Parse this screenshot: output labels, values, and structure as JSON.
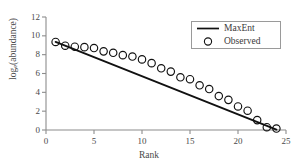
{
  "chart_data": {
    "type": "scatter",
    "title": "",
    "xlabel": "Rank",
    "ylabel_html": "log<sub>e</sub>(abundance)",
    "ylabel": "log_e(abundance)",
    "xlim": [
      0,
      25
    ],
    "ylim": [
      0,
      12
    ],
    "xticks": [
      0,
      5,
      10,
      15,
      20,
      25
    ],
    "yticks": [
      0,
      2,
      4,
      6,
      8,
      10,
      12
    ],
    "grid": false,
    "legend_position": "top-right",
    "series": [
      {
        "name": "MaxEnt",
        "marker": "line",
        "color": "#111111",
        "x": [
          1,
          24
        ],
        "y": [
          9.35,
          0.05
        ]
      },
      {
        "name": "Observed",
        "marker": "open-circle",
        "color": "#111111",
        "x": [
          1,
          2,
          3,
          4,
          5,
          6,
          7,
          8,
          9,
          10,
          11,
          12,
          13,
          14,
          15,
          16,
          17,
          18,
          19,
          20,
          21,
          22,
          23,
          24
        ],
        "y": [
          9.35,
          8.95,
          8.85,
          8.8,
          8.7,
          8.35,
          8.2,
          7.95,
          7.8,
          7.5,
          7.1,
          6.55,
          6.2,
          5.6,
          5.4,
          4.75,
          4.35,
          3.6,
          3.2,
          2.5,
          2.05,
          1.05,
          0.3,
          0.15
        ]
      }
    ]
  },
  "legend": {
    "items": [
      {
        "label": "MaxEnt",
        "symbol": "line"
      },
      {
        "label": "Observed",
        "symbol": "circle"
      }
    ]
  }
}
